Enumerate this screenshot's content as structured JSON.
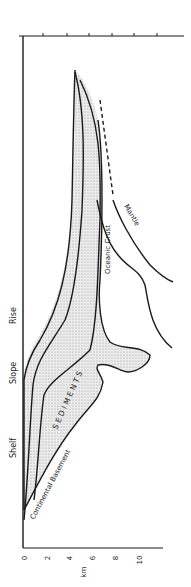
{
  "diagram": {
    "axis": {
      "label": "km",
      "ticks": [
        "0",
        "2",
        "4",
        "6",
        "8",
        "10"
      ]
    },
    "zones": {
      "shelf": "Shelf",
      "slope": "Slope",
      "rise": "Rise"
    },
    "layers": {
      "sediments": "S E D I M E N T S",
      "continental_basement": "Continental  Basement",
      "oceanic_crust": "Oceanic  Crust",
      "mantle": "Mantle"
    },
    "colors": {
      "line": "#1a1a1a",
      "sediment_fill": "#d9d9d9"
    }
  }
}
